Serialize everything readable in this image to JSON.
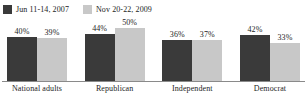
{
  "chart_data": {
    "type": "bar",
    "title": "",
    "subtitle": "",
    "xlabel": "",
    "ylabel": "",
    "ylim": [
      0,
      60
    ],
    "grid": false,
    "legend_position": "top-left",
    "categories": [
      "National adults",
      "Republican",
      "Independent",
      "Democrat"
    ],
    "series": [
      {
        "name": "Jun 11-14, 2007",
        "color": "#3a3a3a",
        "values": [
          40,
          44,
          36,
          42
        ],
        "labels": [
          "40%",
          "44%",
          "36%",
          "42%"
        ]
      },
      {
        "name": "Nov 20-22, 2009",
        "color": "#c8c8c8",
        "values": [
          39,
          50,
          37,
          33
        ],
        "labels": [
          "39%",
          "50%",
          "37%",
          "33%"
        ]
      }
    ]
  },
  "axis": {
    "baseline_color": "#8a8a8a"
  }
}
